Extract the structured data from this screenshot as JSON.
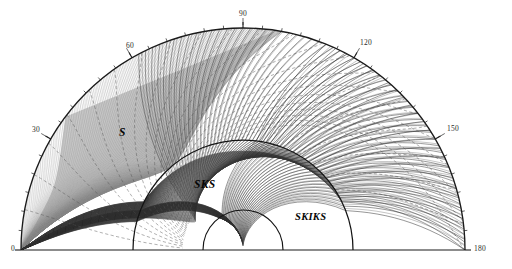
{
  "figure": {
    "type": "seismic-ray-path-diagram",
    "title": ""
  },
  "geometry": {
    "center_x": 243,
    "center_y": 250,
    "surface_radius": 222,
    "cmb_radius": 110,
    "inner_core_radius": 40,
    "baseline_y": 250,
    "baseline_x_start": 21,
    "baseline_x_end": 465
  },
  "angle_labels": [
    {
      "value": "0",
      "deg": 0,
      "x": 11,
      "y": 244
    },
    {
      "value": "30",
      "deg": 30,
      "x": 32,
      "y": 125
    },
    {
      "value": "60",
      "deg": 60,
      "x": 126,
      "y": 41
    },
    {
      "value": "90",
      "deg": 90,
      "x": 239,
      "y": 9
    },
    {
      "value": "120",
      "deg": 120,
      "x": 360,
      "y": 38
    },
    {
      "value": "150",
      "deg": 150,
      "x": 447,
      "y": 124
    },
    {
      "value": "180",
      "deg": 180,
      "x": 474,
      "y": 244
    }
  ],
  "phase_labels": [
    {
      "name": "S",
      "x": 119,
      "y": 126,
      "size": "big"
    },
    {
      "name": "SKS",
      "x": 194,
      "y": 178,
      "size": "big"
    },
    {
      "name": "SKIKS",
      "x": 295,
      "y": 211,
      "size": "normal"
    }
  ],
  "colors": {
    "surface_arc": "#1a1a1a",
    "cmb_arc": "#141414",
    "inner_core_arc": "#141414",
    "s_rays": "#8b8b8b",
    "core_rays": "#2e2e2e",
    "wavefront_dashed": "#555555",
    "shadow_fill": "#9a9a9a",
    "baseline": "#1a1a1a",
    "tick": "#1a1a1a",
    "label_text": "#1a1a1a",
    "background": "#ffffff"
  },
  "chart_data": {
    "type": "line",
    "xlabel": "Epicentral distance (degrees)",
    "ylabel": "",
    "grid": false,
    "legend": "none",
    "axis_range_deg": [
      0,
      180
    ],
    "tick_interval_deg": 5,
    "major_tick_interval_deg": 30,
    "major_ticks": [
      0,
      30,
      60,
      90,
      120,
      150,
      180
    ],
    "layers": [
      {
        "name": "Surface",
        "normalized_radius": 1.0
      },
      {
        "name": "Core-mantle boundary",
        "normalized_radius": 0.4955
      },
      {
        "name": "Inner core boundary",
        "normalized_radius": 0.1802
      }
    ],
    "series": [
      {
        "name": "S",
        "phase": "S",
        "style": "grey-solid",
        "region": "mantle",
        "takeoff_angle_min_deg": 2,
        "takeoff_angle_max_deg": 88,
        "ray_count": 96,
        "description": "Direct S rays turning within the mantle, forming a dense grey bundle with a shadow-zone caustic"
      },
      {
        "name": "SKS",
        "phase": "SKS",
        "style": "dark-solid",
        "region": "outer-core",
        "takeoff_angle_min_deg": 10,
        "takeoff_angle_max_deg": 80,
        "ray_count": 60,
        "description": "S converted to P in the outer core and back to S in the mantle"
      },
      {
        "name": "SKIKS",
        "phase": "SKIKS",
        "style": "dark-solid",
        "region": "inner-core",
        "takeoff_angle_min_deg": 2,
        "takeoff_angle_max_deg": 30,
        "ray_count": 26,
        "description": "SKS-type path that additionally traverses the solid inner core as P"
      },
      {
        "name": "Wavefronts",
        "phase": "wavefront",
        "style": "dashed",
        "count": 22,
        "interval_seconds": 60,
        "description": "Equal-traveltime wavefront arcs drawn as dashed curves"
      }
    ]
  }
}
